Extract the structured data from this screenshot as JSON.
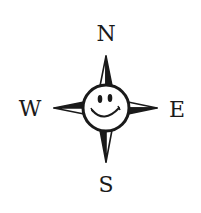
{
  "compass": {
    "labels": {
      "north": "N",
      "south": "S",
      "east": "E",
      "west": "W"
    },
    "center_icon": "smiley-face-icon",
    "colors": {
      "ink": "#1a1a1a",
      "background": "#ffffff"
    }
  }
}
